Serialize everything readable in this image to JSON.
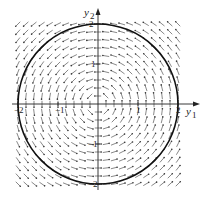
{
  "chart_data": {
    "type": "vector-field",
    "title": "",
    "xlabel": "y1",
    "ylabel": "y2",
    "xlim": [
      -2.1,
      2.1
    ],
    "ylim": [
      -2.1,
      2.1
    ],
    "x_ticks": [
      -2,
      -1,
      1,
      2
    ],
    "y_ticks": [
      -2,
      -1,
      1,
      2
    ],
    "field": {
      "dy1": "-y2",
      "dy2": "y1",
      "grid_spacing": 0.2
    },
    "curves": [
      {
        "name": "circle",
        "center": [
          0,
          0
        ],
        "radius": 2
      }
    ]
  },
  "labels": {
    "x_axis": "y",
    "x_sub": "1",
    "y_axis": "y",
    "y_sub": "2",
    "tick_neg2": "−2",
    "tick_neg1": "−1",
    "tick_1": "1",
    "tick_2": "2"
  }
}
